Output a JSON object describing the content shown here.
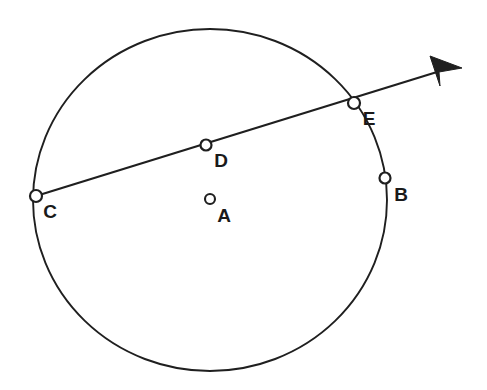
{
  "figure": {
    "background_color": "#ffffff",
    "ink_color": "#1f1f1f",
    "label_color": "#1a1a1a",
    "width": 487,
    "height": 390
  },
  "circle": {
    "name": "main-circle",
    "center_x": 210,
    "center_y": 200,
    "radius_x": 177,
    "radius_y": 171,
    "stroke_color": "#1f1f1f",
    "stroke_width": 1.9,
    "fill": "none"
  },
  "secant": {
    "name": "secant-ray",
    "start_x": 36,
    "start_y": 196,
    "end_x": 437,
    "end_y": 72,
    "stroke_color": "#1f1f1f",
    "stroke_width": 2.3,
    "arrow": {
      "tip_x": 462,
      "tip_y": 68,
      "base_top_x": 430,
      "base_top_y": 56,
      "base_bottom_x": 440,
      "base_bottom_y": 86,
      "fill_color": "#1f1f1f"
    }
  },
  "points": [
    {
      "id": "A",
      "label": "A",
      "role": "center",
      "marker_x": 210,
      "marker_y": 199,
      "marker_radius": 5,
      "label_x": 224,
      "label_y": 217
    },
    {
      "id": "B",
      "label": "B",
      "role": "on-circle",
      "marker_x": 385,
      "marker_y": 178,
      "marker_radius": 5.5,
      "label_x": 401,
      "label_y": 196
    },
    {
      "id": "C",
      "label": "C",
      "role": "on-circle",
      "marker_x": 36,
      "marker_y": 196,
      "marker_radius": 6,
      "label_x": 50,
      "label_y": 213
    },
    {
      "id": "D",
      "label": "D",
      "role": "on-secant",
      "marker_x": 206,
      "marker_y": 145,
      "marker_radius": 5.5,
      "label_x": 221,
      "label_y": 162
    },
    {
      "id": "E",
      "label": "E",
      "role": "on-circle",
      "marker_x": 354,
      "marker_y": 103,
      "marker_radius": 6,
      "label_x": 369,
      "label_y": 120
    }
  ]
}
